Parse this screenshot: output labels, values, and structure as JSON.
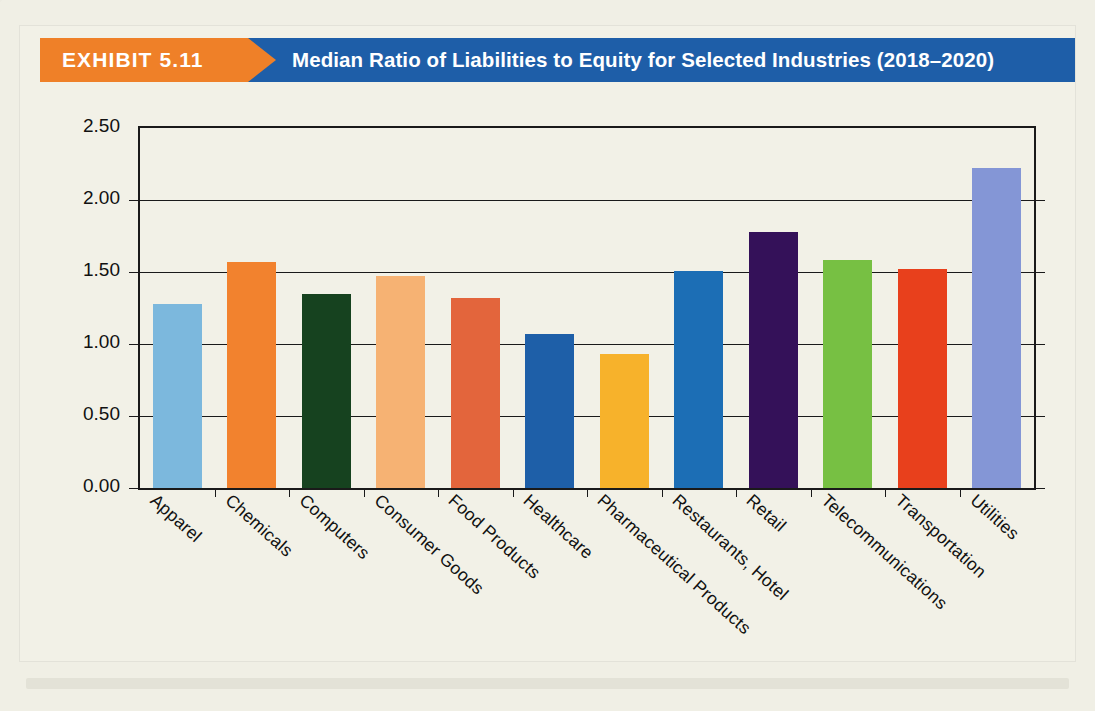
{
  "exhibit": {
    "label": "EXHIBIT 5.11",
    "title": "Median Ratio of Liabilities to Equity for Selected Industries (2018–2020)"
  },
  "theme": {
    "banner_orange": "#ef8028",
    "banner_blue": "#1e5ea8",
    "page_background": "#f0efe5",
    "card_background": "#f2f1e7",
    "axis": "#1a1a1a"
  },
  "chart_data": {
    "type": "bar",
    "title": "Median Ratio of Liabilities to Equity for Selected Industries (2018–2020)",
    "xlabel": "",
    "ylabel": "",
    "ylim": [
      0.0,
      2.5
    ],
    "yticks": [
      "0.00",
      "0.50",
      "1.00",
      "1.50",
      "2.00",
      "2.50"
    ],
    "ytick_values": [
      0.0,
      0.5,
      1.0,
      1.5,
      2.0,
      2.5
    ],
    "grid": true,
    "legend": "none",
    "categories": [
      "Apparel",
      "Chemicals",
      "Computers",
      "Consumer Goods",
      "Food Products",
      "Healthcare",
      "Pharmaceutical Products",
      "Restaurants, Hotel",
      "Retail",
      "Telecommunications",
      "Transportation",
      "Utilities"
    ],
    "values": [
      1.28,
      1.57,
      1.35,
      1.47,
      1.32,
      1.07,
      0.93,
      1.51,
      1.78,
      1.58,
      1.52,
      2.22
    ],
    "colors": [
      "#7cb8dd",
      "#f2822e",
      "#16421f",
      "#f6b273",
      "#e3653c",
      "#1e5fa8",
      "#f7b22b",
      "#1c6eb5",
      "#341159",
      "#77c043",
      "#e8401c",
      "#8496d6"
    ]
  }
}
